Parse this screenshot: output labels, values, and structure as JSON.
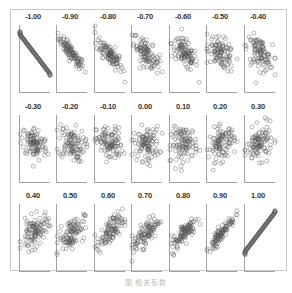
{
  "chart_data": {
    "type": "scatter",
    "title": "",
    "layout": {
      "rows": 3,
      "cols": 7,
      "grid": false,
      "legend": "none"
    },
    "panels": [
      {
        "label": "-1.00",
        "r": -1.0
      },
      {
        "label": "-0.90",
        "r": -0.9
      },
      {
        "label": "-0.80",
        "r": -0.8
      },
      {
        "label": "-0.70",
        "r": -0.7
      },
      {
        "label": "-0.60",
        "r": -0.6
      },
      {
        "label": "-0.50",
        "r": -0.5
      },
      {
        "label": "-0.40",
        "r": -0.4
      },
      {
        "label": "-0.30",
        "r": -0.3
      },
      {
        "label": "-0.20",
        "r": -0.2
      },
      {
        "label": "-0.10",
        "r": -0.1
      },
      {
        "label": "0.00",
        "r": 0.0
      },
      {
        "label": "0.10",
        "r": 0.1
      },
      {
        "label": "0.20",
        "r": 0.2
      },
      {
        "label": "0.30",
        "r": 0.3
      },
      {
        "label": "0.40",
        "r": 0.4
      },
      {
        "label": "0.50",
        "r": 0.5
      },
      {
        "label": "0.60",
        "r": 0.6
      },
      {
        "label": "0.70",
        "r": 0.7
      },
      {
        "label": "0.80",
        "r": 0.8
      },
      {
        "label": "0.90",
        "r": 0.9
      },
      {
        "label": "1.00",
        "r": 1.0
      }
    ],
    "xlabel": "",
    "ylabel": "",
    "marker": "open-circle",
    "points_per_panel": 100
  },
  "caption": "图 相关系数",
  "colors": {
    "marker": "#555555",
    "axis": "#888888",
    "frame": "#c9c9c9",
    "label": "#333333"
  }
}
